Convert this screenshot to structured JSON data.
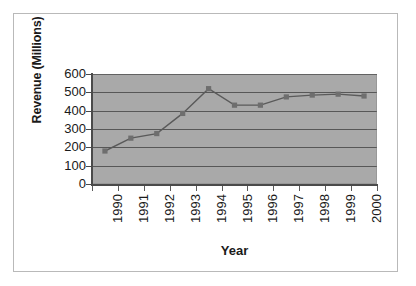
{
  "chart_data": {
    "type": "line",
    "title": "",
    "xlabel": "Year",
    "ylabel": "Revenue (Millions)",
    "categories": [
      "1990",
      "1991",
      "1992",
      "1993",
      "1994",
      "1995",
      "1996",
      "1997",
      "1998",
      "1999",
      "2000"
    ],
    "values": [
      180,
      250,
      275,
      385,
      520,
      430,
      430,
      475,
      485,
      490,
      480
    ],
    "series": [
      {
        "name": "Revenue",
        "values": [
          180,
          250,
          275,
          385,
          520,
          430,
          430,
          475,
          485,
          490,
          480
        ]
      }
    ],
    "ylim": [
      0,
      600
    ],
    "yticks": [
      0,
      100,
      200,
      300,
      400,
      500,
      600
    ],
    "ytick_labels": [
      "0",
      "100",
      "200",
      "300",
      "400",
      "500",
      "600"
    ],
    "grid": "horizontal",
    "legend": "none",
    "plot_background_color": "#a9a9a9",
    "line_color": "#5a5a5a",
    "marker_color": "#6e6e6e",
    "marker_shape": "square",
    "axis_color": "#4a4a4a",
    "figure_background_color": "#ffffff",
    "frame_border_color": "#b9b9b9"
  }
}
